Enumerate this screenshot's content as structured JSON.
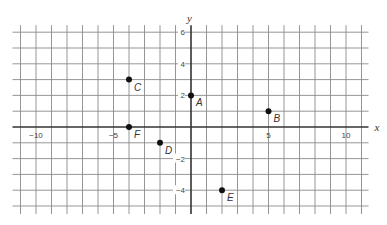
{
  "chart_data": {
    "type": "scatter",
    "title": "",
    "xlabel": "x",
    "ylabel": "y",
    "xlim": [
      -11,
      11
    ],
    "ylim": [
      -5,
      6
    ],
    "grid": true,
    "x_tick_labels": [
      {
        "value": -10,
        "label": "−10"
      },
      {
        "value": -5,
        "label": "−5"
      },
      {
        "value": 5,
        "label": "5"
      },
      {
        "value": 10,
        "label": "10"
      }
    ],
    "y_tick_labels": [
      {
        "value": 6,
        "label": "6"
      },
      {
        "value": 4,
        "label": "4"
      },
      {
        "value": 2,
        "label": "2"
      },
      {
        "value": -2,
        "label": "−2"
      },
      {
        "value": -4,
        "label": "−4"
      }
    ],
    "points": [
      {
        "label": "A",
        "x": 0,
        "y": 2
      },
      {
        "label": "B",
        "x": 5,
        "y": 1
      },
      {
        "label": "C",
        "x": -4,
        "y": 3
      },
      {
        "label": "D",
        "x": -2,
        "y": -1
      },
      {
        "label": "E",
        "x": 2,
        "y": -4
      },
      {
        "label": "F",
        "x": -4,
        "y": 0
      }
    ]
  },
  "layout": {
    "origin_px": [
      191,
      127
    ],
    "x_unit_px": 15.5,
    "y_unit_px": 15.8,
    "grid_x_range": [
      -11,
      11
    ],
    "grid_y_range": [
      -5,
      6
    ]
  }
}
